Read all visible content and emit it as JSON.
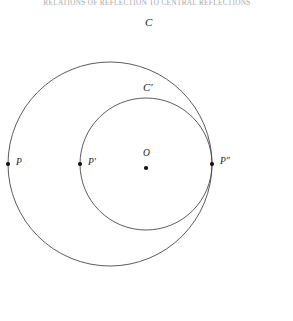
{
  "page": {
    "running_header": "RELATIONS OF REFLECTION TO CENTRAL REFLECTIONS",
    "background_color": "#ffffff",
    "ink_color": "#1c1c1c",
    "width": 293,
    "height": 321
  },
  "figure": {
    "name": "two-concentric-circles-diagram",
    "stroke_color": "#4a4a4a",
    "point_color": "#101010",
    "circles": [
      {
        "id": "outer",
        "label": "C",
        "center_x": 110,
        "center_y": 164,
        "radius": 102,
        "label_x": 145,
        "label_y": 17
      },
      {
        "id": "inner",
        "label": "C′",
        "center_x": 146,
        "center_y": 164,
        "radius": 66,
        "label_x": 143,
        "label_y": 82
      }
    ],
    "points": [
      {
        "id": "P",
        "label": "P",
        "x": 8,
        "y": 164,
        "label_x": 16,
        "label_y": 158,
        "on": "outer"
      },
      {
        "id": "P-prime",
        "label": "P′",
        "x": 80,
        "y": 164,
        "label_x": 88,
        "label_y": 158,
        "on": "inner"
      },
      {
        "id": "O",
        "label": "O",
        "x": 146,
        "y": 168,
        "label_x": 143,
        "label_y": 149,
        "on": "centre"
      },
      {
        "id": "P-double-prime",
        "label": "P″",
        "x": 212,
        "y": 164,
        "label_x": 220,
        "label_y": 157,
        "on": "inner"
      }
    ]
  }
}
